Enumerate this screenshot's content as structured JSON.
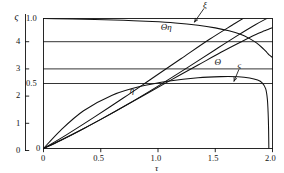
{
  "figure": {
    "background": "#ffffff",
    "ink": "#111111"
  },
  "chart_data": {
    "type": "line",
    "title": "",
    "subtitle": "",
    "xlabel": "τ",
    "ylabel_left_outer": "ς",
    "ylabel_inner": "",
    "grid": true,
    "legend_position": "inline-annotations",
    "xlim": [
      0,
      2.0
    ],
    "xticks": [
      0,
      0.5,
      1.0,
      1.5,
      2.0
    ],
    "xticklabels": [
      "0",
      "0.5",
      "1.0",
      "1.5",
      "2.0"
    ],
    "left_axis": {
      "label": "ς",
      "lim": [
        0,
        5
      ],
      "ticks": [
        0,
        1,
        2,
        3,
        4
      ],
      "ticklabels": [
        "0",
        "1",
        "2",
        "3",
        "4"
      ],
      "top_symbol": "ς"
    },
    "inner_axis": {
      "lim": [
        0,
        1.0
      ],
      "ticks": [
        0,
        0.5,
        1.0
      ],
      "ticklabels": [
        "0",
        "0.5",
        "1.0"
      ]
    },
    "gridlines_horizontal_left_units": [
      4.0,
      3.0
    ],
    "gridlines_horizontal_inner_units": [
      0.5
    ],
    "series": [
      {
        "name": "Θη",
        "label": "Θη",
        "label_x": 1.05,
        "label_y_inner": 0.93,
        "axis": "inner",
        "has_leader": false,
        "x": [
          0.0,
          0.1,
          0.25,
          0.45,
          0.7,
          0.95,
          1.15,
          1.35,
          1.5,
          1.62,
          1.72,
          1.8,
          1.86,
          1.91,
          1.95,
          1.97,
          2.0
        ],
        "y": [
          1.0,
          0.999,
          0.997,
          0.993,
          0.986,
          0.977,
          0.966,
          0.948,
          0.928,
          0.905,
          0.878,
          0.845,
          0.812,
          0.775,
          0.74,
          0.72,
          0.7
        ]
      },
      {
        "name": "ξ",
        "label": "ξ",
        "label_x": 1.42,
        "label_y_inner": 1.1,
        "axis": "inner",
        "has_leader": true,
        "leader_from_x": 1.4,
        "leader_from_y_inner": 1.075,
        "leader_to_x": 1.32,
        "leader_to_y_inner": 0.975,
        "x": [
          0.0,
          0.2,
          0.45,
          0.7,
          0.95,
          1.2,
          1.45,
          1.65,
          1.8,
          1.9,
          1.95,
          2.0
        ],
        "y": [
          0.0,
          0.105,
          0.245,
          0.39,
          0.54,
          0.69,
          0.84,
          0.95,
          1.03,
          1.075,
          1.095,
          1.11
        ]
      },
      {
        "name": "Θ",
        "label": "Θ",
        "label_x": 1.52,
        "label_y_inner": 0.655,
        "axis": "inner",
        "has_leader": false,
        "x": [
          0.0,
          0.15,
          0.35,
          0.6,
          0.85,
          1.1,
          1.35,
          1.55,
          1.72,
          1.85,
          1.93,
          1.97,
          2.0
        ],
        "y": [
          0.0,
          0.062,
          0.152,
          0.272,
          0.396,
          0.52,
          0.642,
          0.74,
          0.818,
          0.875,
          0.905,
          0.92,
          0.93
        ]
      },
      {
        "name": "ς",
        "label": "ς",
        "label_x": 1.72,
        "label_y_inner": 0.635,
        "axis": "inner",
        "has_leader": true,
        "leader_from_x": 1.705,
        "leader_from_y_inner": 0.605,
        "leader_to_x": 1.665,
        "leader_to_y_inner": 0.52,
        "x": [
          0.0,
          0.15,
          0.35,
          0.6,
          0.85,
          1.1,
          1.35,
          1.55,
          1.7,
          1.8,
          1.87,
          1.91,
          1.94,
          1.955,
          1.962,
          1.966,
          1.968
        ],
        "y": [
          0.0,
          0.14,
          0.29,
          0.41,
          0.478,
          0.52,
          0.545,
          0.553,
          0.552,
          0.543,
          0.527,
          0.505,
          0.46,
          0.38,
          0.27,
          0.14,
          0.0
        ]
      },
      {
        "name": "η",
        "label": "η",
        "label_x": 0.78,
        "label_y_inner": 0.445,
        "axis": "inner",
        "has_leader": false,
        "x": [
          0.0,
          0.25,
          0.5,
          0.75,
          1.0,
          1.25,
          1.5,
          1.7,
          1.85,
          1.95,
          2.0
        ],
        "y": [
          0.0,
          0.108,
          0.224,
          0.348,
          0.48,
          0.618,
          0.76,
          0.872,
          0.952,
          1.0,
          1.022
        ]
      }
    ],
    "annotations": [
      {
        "text": "ς",
        "role": "left-axis-top-symbol"
      },
      {
        "text": "τ",
        "role": "x-axis-label"
      }
    ]
  }
}
